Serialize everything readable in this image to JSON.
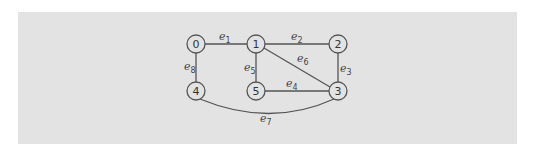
{
  "diagram": {
    "type": "graph",
    "background_color": "#e3e3e3",
    "nodes": [
      {
        "id": "0",
        "label": "0",
        "x": 196,
        "y": 44
      },
      {
        "id": "1",
        "label": "1",
        "x": 256,
        "y": 44
      },
      {
        "id": "2",
        "label": "2",
        "x": 338,
        "y": 44
      },
      {
        "id": "3",
        "label": "3",
        "x": 338,
        "y": 91
      },
      {
        "id": "4",
        "label": "4",
        "x": 196,
        "y": 91
      },
      {
        "id": "5",
        "label": "5",
        "x": 256,
        "y": 91
      }
    ],
    "edges": [
      {
        "id": "e1",
        "base": "e",
        "sub": "1",
        "from": "0",
        "to": "1"
      },
      {
        "id": "e2",
        "base": "e",
        "sub": "2",
        "from": "1",
        "to": "2"
      },
      {
        "id": "e3",
        "base": "e",
        "sub": "3",
        "from": "2",
        "to": "3"
      },
      {
        "id": "e4",
        "base": "e",
        "sub": "4",
        "from": "5",
        "to": "3"
      },
      {
        "id": "e5",
        "base": "e",
        "sub": "5",
        "from": "1",
        "to": "5"
      },
      {
        "id": "e6",
        "base": "e",
        "sub": "6",
        "from": "1",
        "to": "3"
      },
      {
        "id": "e7",
        "base": "e",
        "sub": "7",
        "from": "4",
        "to": "3"
      },
      {
        "id": "e8",
        "base": "e",
        "sub": "8",
        "from": "0",
        "to": "4"
      }
    ]
  }
}
